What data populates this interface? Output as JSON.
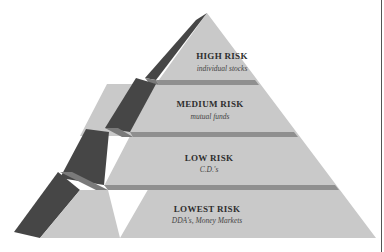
{
  "diagram": {
    "type": "pyramid",
    "colors": {
      "face": "#c9c9c9",
      "band": "#8f8f8f",
      "side_dark": "#464646",
      "side_light": "#7a7a7a"
    },
    "tiers": [
      {
        "title": "HIGH RISK",
        "subtitle": "individual stocks"
      },
      {
        "title": "MEDIUM RISK",
        "subtitle": "mutual funds"
      },
      {
        "title": "LOW RISK",
        "subtitle": "C.D.'s"
      },
      {
        "title": "LOWEST RISK",
        "subtitle": "DDA's, Money Markets"
      }
    ]
  }
}
